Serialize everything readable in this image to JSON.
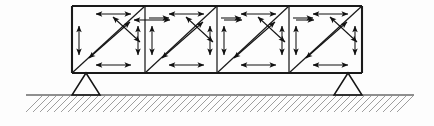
{
  "figure": {
    "type": "structural-diagram",
    "width": 434,
    "height": 126,
    "background": "#fdfdfd",
    "line_color": "#1a1a1a",
    "hatch_color": "#8d8d8d"
  },
  "truss": {
    "label": "truss-girder",
    "left": 72,
    "right": 362,
    "top": 6,
    "bottom": 73,
    "panel_count": 4,
    "panel_boundaries": [
      72,
      145,
      217,
      289,
      362
    ],
    "chord_stroke_width": 2.1,
    "web_stroke_width": 1.25,
    "diagonal_direction": "bottom-left-to-top-right"
  },
  "supports": [
    {
      "name": "left-support",
      "apex_x": 86,
      "apex_y": 73,
      "base_y": 95,
      "half_width": 14
    },
    {
      "name": "right-support",
      "apex_x": 348,
      "apex_y": 73,
      "base_y": 95,
      "half_width": 14
    }
  ],
  "ground": {
    "label": "ground-hatching",
    "line_y": 95,
    "left": 26,
    "right": 414,
    "hatch_depth": 17,
    "hatch_spacing": 7,
    "hatch_angle_deg": 45
  },
  "arrow_groups": [
    {
      "name": "top-chord-horizontal-arrows",
      "count": 4,
      "orientation": "horizontal",
      "style": "double-headed"
    },
    {
      "name": "bottom-chord-horizontal-arrows",
      "count": 4,
      "orientation": "horizontal",
      "style": "double-headed"
    },
    {
      "name": "vertical-post-arrows",
      "count": 9,
      "orientation": "vertical",
      "style": "double-headed"
    },
    {
      "name": "diagonal-tension-arrows",
      "count": 4,
      "orientation": "diagonal-up-right",
      "style": "double-headed"
    },
    {
      "name": "diagonal-compression-arrows",
      "count": 4,
      "orientation": "diagonal-down-right",
      "style": "double-headed"
    },
    {
      "name": "short-inward-arrows",
      "count": 8,
      "orientation": "horizontal",
      "style": "single-headed"
    }
  ]
}
